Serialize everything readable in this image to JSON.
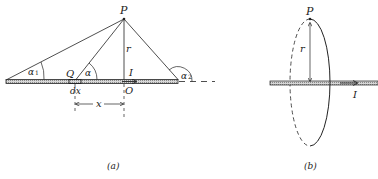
{
  "panel_a": {
    "caption": "(a)",
    "point_p": "P",
    "point_q": "Q",
    "point_o": "O",
    "radius": "r",
    "current": "I",
    "angle_1": "α",
    "angle_1_sub": "1",
    "angle": "α",
    "angle_2": "α",
    "angle_2_sub": "2",
    "element": "dx",
    "distance": "x"
  },
  "panel_b": {
    "caption": "(b)",
    "point_p": "P",
    "radius": "r",
    "current": "I"
  },
  "colors": {
    "line": "#222222",
    "wire_fill": "#bdbdbd"
  }
}
